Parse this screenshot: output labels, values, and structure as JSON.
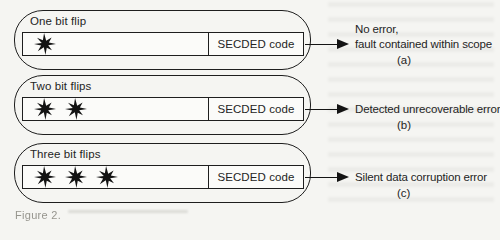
{
  "figure": {
    "rows": [
      {
        "id": "a",
        "scenario_label": "One bit flip",
        "flip_count": 1,
        "code_label": "SECDED code",
        "outcome_lines": [
          "No error,",
          "fault contained within scope"
        ],
        "sub_label": "(a)"
      },
      {
        "id": "b",
        "scenario_label": "Two bit flips",
        "flip_count": 2,
        "code_label": "SECDED code",
        "outcome_lines": [
          "Detected unrecoverable error"
        ],
        "sub_label": "(b)"
      },
      {
        "id": "c",
        "scenario_label": "Three bit flips",
        "flip_count": 3,
        "code_label": "SECDED code",
        "outcome_lines": [
          "Silent data corruption error"
        ],
        "sub_label": "(c)"
      }
    ],
    "caption_fragment": "Figure 2.",
    "icons": {
      "bit_flip": "burst-icon",
      "result_pointer": "arrow-right-icon"
    },
    "colors": {
      "ink": "#1e1e1e",
      "paper": "#f5f5f2",
      "box_fill": "#fbfbf9"
    }
  }
}
